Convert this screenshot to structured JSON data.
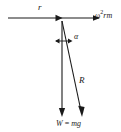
{
  "figure": {
    "type": "physics-force-diagram",
    "background_color": "#ffffff",
    "stroke_color": "#1a1a1a",
    "labels": {
      "radius": "r",
      "centripetal_force_prefix": "ω",
      "centripetal_force_exponent": "2",
      "centripetal_force_suffix": "rm",
      "angle": "α",
      "resultant": "R",
      "weight_symbol": "W",
      "weight_equals": " = ",
      "weight_value": "mg"
    },
    "elements": [
      {
        "name": "radius-arrow",
        "kind": "arrow",
        "from": [
          8,
          18
        ],
        "to": [
          100,
          18
        ],
        "label": "r"
      },
      {
        "name": "centripetal-arrowhead",
        "kind": "arrowhead",
        "at": [
          61,
          18
        ]
      },
      {
        "name": "weight-arrow",
        "kind": "arrow",
        "from": [
          62,
          22
        ],
        "to": [
          62,
          117
        ],
        "label": "W = mg"
      },
      {
        "name": "resultant-arrow",
        "kind": "arrow",
        "from": [
          62,
          22
        ],
        "to": [
          82,
          117
        ],
        "label": "R"
      },
      {
        "name": "angle-indicator",
        "kind": "double-arrow",
        "from": [
          55,
          41
        ],
        "to": [
          72,
          41
        ],
        "label": "α"
      }
    ]
  }
}
